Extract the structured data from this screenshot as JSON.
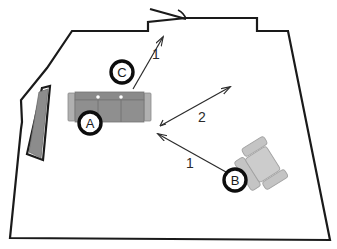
{
  "plan": {
    "title": "Room floor plan with seating layout",
    "background_color": "#ffffff",
    "wall_color": "#1a1a1a",
    "wall_thickness": 2.2,
    "outline_points": "72,31 148,31 148,22 186,18 188,18 257,18 257,31 288,31 330,240 10,238 21,129 22,122 21,100 47,68 72,31",
    "window": {
      "name": "window-opening",
      "fill_color": "#8c8c8c",
      "outline_color": "#1a1a1a",
      "panel_points": "39,92 48,89 41,158 29,152",
      "frame_points": "42,88 50,86 43,160 27,154"
    },
    "door": {
      "name": "door-swing",
      "leaf_from": "186,19",
      "leaf_to": "150,9",
      "arc_path": "M 186,19 A 16,16 0 0 0 178,10"
    }
  },
  "furniture": [
    {
      "id": "sofa",
      "label": "A",
      "type": "three-seat-sofa",
      "body_color": "#8c8c8c",
      "frame_color": "#b5b5b5",
      "line_color": "#6d6d6d",
      "x": 68,
      "y": 92,
      "width": 83,
      "height": 30
    },
    {
      "id": "armchair",
      "label": "B",
      "type": "armchair",
      "body_color": "#c4c4c4",
      "line_color": "#9a9a9a",
      "x": 240,
      "y": 148,
      "width": 44,
      "height": 36,
      "rotation": -32
    }
  ],
  "markers": [
    {
      "name": "marker-a",
      "label": "A",
      "cx": 90,
      "cy": 123,
      "r": 11
    },
    {
      "name": "marker-b",
      "label": "B",
      "cx": 235,
      "cy": 180,
      "r": 11
    },
    {
      "name": "marker-c",
      "label": "C",
      "cx": 122,
      "cy": 72,
      "r": 11
    }
  ],
  "dimensions": [
    {
      "name": "dimension-1-top",
      "label": "1",
      "from_x": 133,
      "from_y": 89,
      "to_x": 163,
      "to_y": 37,
      "label_x": 156,
      "label_y": 54
    },
    {
      "name": "dimension-2-middle",
      "label": "2",
      "from_x": 160,
      "from_y": 126,
      "to_x": 229,
      "to_y": 88,
      "label_x": 202,
      "label_y": 117
    },
    {
      "name": "dimension-1-bottom",
      "label": "1",
      "from_x": 226,
      "from_y": 172,
      "to_x": 157,
      "to_y": 133,
      "label_x": 190,
      "label_y": 163
    }
  ]
}
